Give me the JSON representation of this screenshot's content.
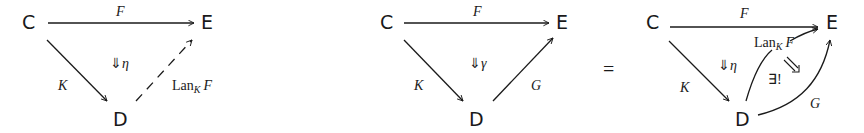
{
  "diagram_left": {
    "objects": {
      "C": "C",
      "E": "E",
      "D": "D"
    },
    "arrows": {
      "top": "F",
      "left": "K",
      "right_base": "Lan",
      "right_sub": "K",
      "right_arg": "F"
    },
    "two_cell": {
      "arrow": "⇓",
      "name": "η"
    },
    "right_arrow_style": "dashed"
  },
  "diagram_middle": {
    "objects": {
      "C": "C",
      "E": "E",
      "D": "D"
    },
    "arrows": {
      "top": "F",
      "left": "K",
      "right": "G"
    },
    "two_cell": {
      "arrow": "⇓",
      "name": "γ"
    }
  },
  "equals": "=",
  "diagram_right": {
    "objects": {
      "C": "C",
      "E": "E",
      "D": "D"
    },
    "arrows": {
      "top": "F",
      "left": "K",
      "lan_base": "Lan",
      "lan_sub": "K",
      "lan_arg": "F",
      "outer": "G"
    },
    "two_cell": {
      "arrow": "⇓",
      "name": "η"
    },
    "unique_cell": {
      "label": "∃!"
    }
  }
}
